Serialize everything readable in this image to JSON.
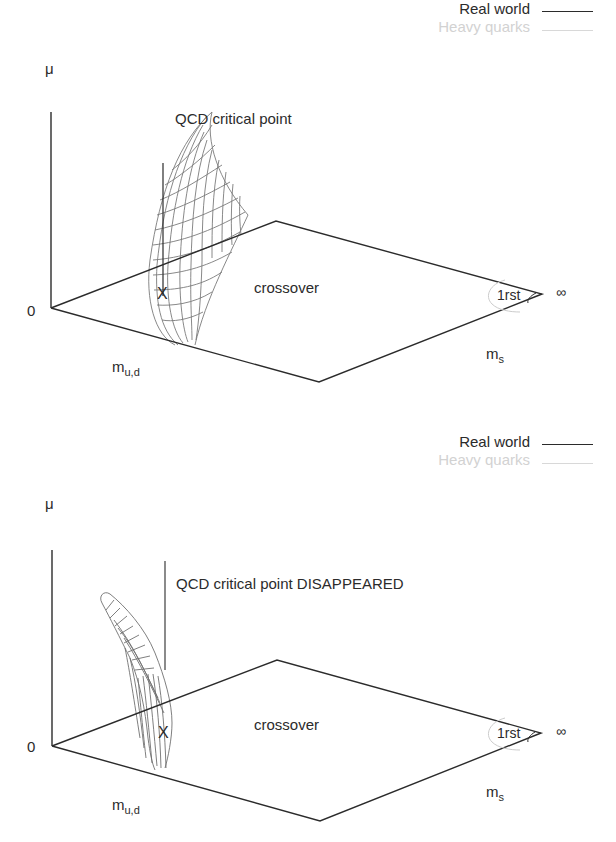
{
  "figures": [
    {
      "id": "top",
      "legend": [
        {
          "label": "Real world",
          "color": "#2b2b2b",
          "style": "solid"
        },
        {
          "label": "Heavy quarks",
          "color": "#d2d2d2",
          "style": "solid"
        }
      ],
      "axis_mu": "μ",
      "origin_label": "0",
      "axis_mud": "m",
      "axis_mud_sub": "u,d",
      "axis_ms": "m",
      "axis_ms_sub": "s",
      "infinity": "∞",
      "region_crossover": "crossover",
      "region_first_order": "1rst",
      "critical_point_label": "QCD critical point",
      "marker": "X"
    },
    {
      "id": "bottom",
      "legend": [
        {
          "label": "Real world",
          "color": "#2b2b2b",
          "style": "solid"
        },
        {
          "label": "Heavy quarks",
          "color": "#d2d2d2",
          "style": "solid"
        }
      ],
      "axis_mu": "μ",
      "origin_label": "0",
      "axis_mud": "m",
      "axis_mud_sub": "u,d",
      "axis_ms": "m",
      "axis_ms_sub": "s",
      "infinity": "∞",
      "region_crossover": "crossover",
      "region_first_order": "1rst",
      "critical_point_label": "QCD critical point DISAPPEARED",
      "marker": "X"
    }
  ],
  "colors": {
    "axis": "#2b2b2b",
    "mesh": "#6e6e6e",
    "heavy_quarks": "#d2d2d2"
  }
}
